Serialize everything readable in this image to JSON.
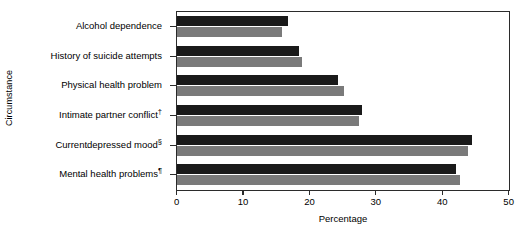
{
  "chart_data": {
    "type": "bar",
    "orientation": "horizontal",
    "title": "",
    "xlabel": "Percentage",
    "ylabel": "Circumstance",
    "xlim": [
      0,
      50
    ],
    "xticks": [
      0,
      10,
      20,
      30,
      40,
      50
    ],
    "xtick_labels": [
      "0",
      "10",
      "20",
      "30",
      "40",
      "50"
    ],
    "grid": false,
    "legend_position": "top-right",
    "categories": [
      "Alcohol dependence",
      "History of suicide attempts",
      "Physical health problem",
      "Intimate partner conflict†",
      "Currentdepressed mood§",
      "Mental health problems¶"
    ],
    "series": [
      {
        "name": "2004",
        "color": "#1a1a1a",
        "values": [
          16.7,
          18.3,
          24.2,
          27.9,
          44.4,
          42.0
        ]
      },
      {
        "name": "2003",
        "color": "#7a7a7a",
        "values": [
          15.8,
          18.8,
          25.2,
          27.4,
          43.8,
          42.6
        ]
      }
    ]
  },
  "legend": {
    "entries": [
      {
        "label": "2004",
        "color": "#1a1a1a"
      },
      {
        "label": "2003",
        "color": "#7a7a7a"
      }
    ]
  }
}
